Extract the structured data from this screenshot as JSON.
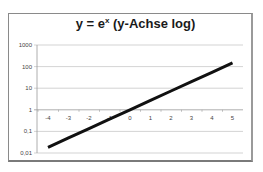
{
  "chart_data": {
    "type": "line",
    "title_parts": {
      "base": "y = e",
      "exponent": "x",
      "suffix": " (y-Achse log)"
    },
    "xlabel": "",
    "ylabel": "",
    "x_ticks": [
      "-4",
      "-3",
      "-2",
      "-1",
      "0",
      "1",
      "2",
      "3",
      "4",
      "5"
    ],
    "y_ticks": [
      "0,01",
      "0,1",
      "1",
      "10",
      "100",
      "1000"
    ],
    "y_scale": "log",
    "ylim": [
      0.01,
      1000
    ],
    "xlim": [
      -4,
      5
    ],
    "grid": true,
    "legend": "none",
    "series": [
      {
        "name": "e^x",
        "x": [
          -4,
          -3,
          -2,
          -1,
          0,
          1,
          2,
          3,
          4,
          5
        ],
        "values": [
          0.0183,
          0.0498,
          0.1353,
          0.3679,
          1,
          2.718,
          7.389,
          20.09,
          54.6,
          148.4
        ],
        "color": "#111111"
      }
    ]
  }
}
